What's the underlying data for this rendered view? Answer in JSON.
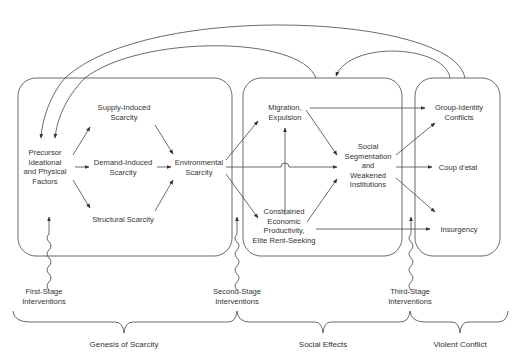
{
  "stages": {
    "genesis": {
      "nodes": {
        "precursor": [
          "Precursor",
          "Ideational",
          "and Physical",
          "Factors"
        ],
        "supply": [
          "Supply-Induced",
          "Scarcity"
        ],
        "demand": [
          "Demand-Induced",
          "Scarcity"
        ],
        "structural": [
          "Structural Scarcity"
        ],
        "environmental": [
          "Environmental",
          "Scarcity"
        ]
      }
    },
    "social": {
      "nodes": {
        "migration": [
          "Migration,",
          "Expulsion"
        ],
        "segmentation": [
          "Social",
          "Segmentation",
          "and",
          "Weakened",
          "Institutions"
        ],
        "constrained": [
          "Constrained",
          "Economic",
          "Productivity,",
          "Elite Rent-Seeking"
        ]
      }
    },
    "violent": {
      "nodes": {
        "group": [
          "Group-Identity",
          "Conflicts"
        ],
        "coup": [
          "Coup d'etat"
        ],
        "insurgency": [
          "Insurgency"
        ]
      }
    }
  },
  "interventions": {
    "first": [
      "First-Stage",
      "Interventions"
    ],
    "second": [
      "Second-Stage",
      "Interventions"
    ],
    "third": [
      "Third-Stage",
      "Interventions"
    ]
  },
  "phases": {
    "genesis": "Genesis of Scarcity",
    "social": "Social Effects",
    "violent": "Violent Conflict"
  },
  "colors": {
    "line": "#333333",
    "text": "#333333",
    "background": "#ffffff"
  }
}
